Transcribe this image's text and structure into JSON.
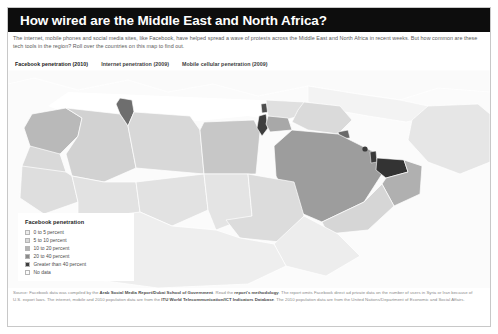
{
  "header": {
    "title": "How wired are the Middle East and North Africa?",
    "deck": "The internet, mobile phones and social media sites, like Facebook, have helped spread a wave of protests across the Middle East and North Africa in recent weeks. But how common are these tech tools in the region? Roll over the countries on this map to find out."
  },
  "tabs": [
    {
      "label": "Facebook penetration (2010)",
      "active": true
    },
    {
      "label": "Internet penetration (2009)",
      "active": false
    },
    {
      "label": "Mobile cellular penetration (2009)",
      "active": false
    }
  ],
  "legend": {
    "title": "Facebook penetration",
    "items": [
      {
        "label": "0 to 5 percent",
        "color": "#ececec"
      },
      {
        "label": "5 to 10 percent",
        "color": "#d8d8d8"
      },
      {
        "label": "10 to 20 percent",
        "color": "#b4b4b4"
      },
      {
        "label": "20 to 40 percent",
        "color": "#8a8a8a"
      },
      {
        "label": "Greater than 40 percent",
        "color": "#3d3d3d"
      },
      {
        "label": "No data",
        "color": "#fbfbfb"
      }
    ]
  },
  "footer": {
    "line1_a": "Source: Facebook data was compiled by the ",
    "line1_b": "Arab Social Media Report/Dubai School of Government",
    "line1_c": ". Read the ",
    "line1_d": "report's methodology",
    "line1_e": ". The report omits Facebook direct ad",
    "line2": "private data on the number of users in Syria or Iran because of U.S. export laws. The internet, mobile and 2010 population data are from the ",
    "line2_b": "ITU World",
    "line3_a": "Telecommunication/ICT Indicators Database",
    "line3_b": ". The 2010 population data are from the United Nations/Department of Economic and Social Affairs."
  },
  "colors": {
    "title_bar": "#0d0d0d",
    "ocean": "#fbfbfb",
    "map_default": "#e3e3e3",
    "frame": "#c8c8c8"
  },
  "map": {
    "regions": [
      {
        "name": "morocco",
        "bucket": "10 to 20 percent",
        "fill": "#b9b9b9"
      },
      {
        "name": "western-sahara",
        "bucket": "No data",
        "fill": "#d9d9d9"
      },
      {
        "name": "algeria",
        "bucket": "5 to 10 percent",
        "fill": "#d2d2d2"
      },
      {
        "name": "tunisia",
        "bucket": "20 to 40 percent",
        "fill": "#6e6e6e"
      },
      {
        "name": "libya",
        "bucket": "0 to 5 percent",
        "fill": "#d8d8d8"
      },
      {
        "name": "egypt",
        "bucket": "5 to 10 percent",
        "fill": "#c7c7c7"
      },
      {
        "name": "sudan",
        "bucket": "0 to 5 percent",
        "fill": "#dcdcdc"
      },
      {
        "name": "mauritania",
        "bucket": "0 to 5 percent",
        "fill": "#dedede"
      },
      {
        "name": "mali",
        "bucket": "0 to 5 percent",
        "fill": "#e2e2e2"
      },
      {
        "name": "niger",
        "bucket": "0 to 5 percent",
        "fill": "#e2e2e2"
      },
      {
        "name": "chad",
        "bucket": "0 to 5 percent",
        "fill": "#e4e4e4"
      },
      {
        "name": "saudi-arabia",
        "bucket": "10 to 20 percent",
        "fill": "#9d9d9d"
      },
      {
        "name": "yemen",
        "bucket": "0 to 5 percent",
        "fill": "#d6d6d6"
      },
      {
        "name": "oman",
        "bucket": "10 to 20 percent",
        "fill": "#b0b0b0"
      },
      {
        "name": "uae",
        "bucket": "Greater than 40 percent",
        "fill": "#333333"
      },
      {
        "name": "qatar",
        "bucket": "Greater than 40 percent",
        "fill": "#3a3a3a"
      },
      {
        "name": "bahrain",
        "bucket": "Greater than 40 percent",
        "fill": "#3a3a3a"
      },
      {
        "name": "kuwait",
        "bucket": "20 to 40 percent",
        "fill": "#6a6a6a"
      },
      {
        "name": "iraq",
        "bucket": "0 to 5 percent",
        "fill": "#dadada"
      },
      {
        "name": "iran",
        "bucket": "No data",
        "fill": "#e6e6e6"
      },
      {
        "name": "syria",
        "bucket": "No data",
        "fill": "#e0e0e0"
      },
      {
        "name": "jordan",
        "bucket": "10 to 20 percent",
        "fill": "#a8a8a8"
      },
      {
        "name": "lebanon",
        "bucket": "20 to 40 percent",
        "fill": "#4f4f4f"
      },
      {
        "name": "israel",
        "bucket": "Greater than 40 percent",
        "fill": "#3d3d3d"
      },
      {
        "name": "turkey",
        "bucket": "No data",
        "fill": "#f3f3f3"
      },
      {
        "name": "europe",
        "bucket": "No data",
        "fill": "#fafafa"
      }
    ]
  }
}
